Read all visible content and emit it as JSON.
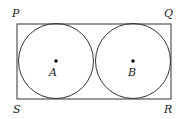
{
  "figure": {
    "rectangle": {
      "x": 17,
      "y": 24,
      "width": 154,
      "height": 75,
      "stroke": "#333333"
    },
    "circles": [
      {
        "label": "A",
        "cx": 56,
        "cy": 61,
        "r": 38
      },
      {
        "label": "B",
        "cx": 133,
        "cy": 61,
        "r": 38
      }
    ],
    "vertices": {
      "P": "P",
      "Q": "Q",
      "R": "R",
      "S": "S"
    },
    "centers": {
      "A": "A",
      "B": "B"
    }
  }
}
